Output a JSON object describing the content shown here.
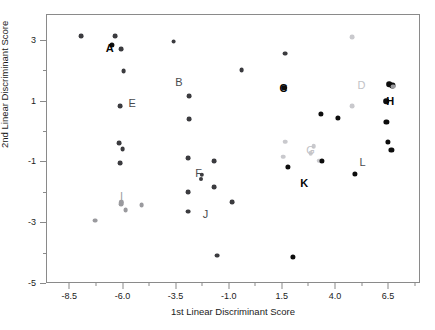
{
  "chart_data": {
    "type": "scatter",
    "title": "",
    "xlabel": "1st Linear Discriminant Score",
    "ylabel": "2nd Linear Discriminant Score",
    "xlim": [
      -9.6,
      8.0
    ],
    "ylim": [
      -5.0,
      3.85
    ],
    "xticks": [
      -8.5,
      -6.0,
      -3.5,
      -1.0,
      1.5,
      4.0,
      6.5
    ],
    "xticklabels": [
      "-8.5",
      "-6.0",
      "-3.5",
      "-1.0",
      "1.5",
      "4.0",
      "6.5"
    ],
    "yticks": [
      3,
      1,
      -1,
      -3,
      -5
    ],
    "yticklabels": [
      "3",
      "1",
      "-1",
      "-3",
      "-5"
    ],
    "xminorticks": [
      -7.25,
      -4.75,
      -2.25,
      0.25,
      2.75,
      5.25,
      7.75
    ],
    "yminorticks": [
      2,
      0,
      -2,
      -4
    ],
    "grid": false,
    "legend": "none",
    "colors": {
      "dark": "#3b3b3f",
      "black": "#0d0d0d",
      "mid": "#9a9a9e",
      "light": "#c9c9cd",
      "axis": "#8a8a8a",
      "text": "#1b1b1b"
    },
    "points": [
      {
        "x": -7.95,
        "y": 3.12,
        "tone": "dark",
        "r": 2.4
      },
      {
        "x": -6.35,
        "y": 3.12,
        "tone": "dark",
        "r": 2.4
      },
      {
        "x": -6.5,
        "y": 2.82,
        "tone": "black",
        "r": 2.6
      },
      {
        "x": -6.05,
        "y": 2.7,
        "tone": "dark",
        "r": 2.4
      },
      {
        "x": -5.95,
        "y": 1.96,
        "tone": "dark",
        "r": 2.4
      },
      {
        "x": -6.1,
        "y": 0.82,
        "tone": "dark",
        "r": 2.4
      },
      {
        "x": -6.15,
        "y": -0.4,
        "tone": "dark",
        "r": 2.4
      },
      {
        "x": -6.0,
        "y": -0.6,
        "tone": "dark",
        "r": 2.4
      },
      {
        "x": -6.12,
        "y": -1.05,
        "tone": "dark",
        "r": 2.4
      },
      {
        "x": -7.3,
        "y": -2.95,
        "tone": "mid",
        "r": 2.4
      },
      {
        "x": -6.05,
        "y": -2.4,
        "tone": "mid",
        "r": 2.4
      },
      {
        "x": -5.85,
        "y": -2.6,
        "tone": "mid",
        "r": 2.4
      },
      {
        "x": -5.1,
        "y": -2.45,
        "tone": "mid",
        "r": 2.4
      },
      {
        "x": -3.6,
        "y": 2.94,
        "tone": "dark",
        "r": 2.4
      },
      {
        "x": -2.85,
        "y": 1.15,
        "tone": "dark",
        "r": 2.4
      },
      {
        "x": -2.88,
        "y": 0.38,
        "tone": "dark",
        "r": 2.4
      },
      {
        "x": -2.92,
        "y": -0.88,
        "tone": "dark",
        "r": 2.4
      },
      {
        "x": -2.9,
        "y": -2.0,
        "tone": "dark",
        "r": 2.4
      },
      {
        "x": -2.9,
        "y": -2.65,
        "tone": "dark",
        "r": 2.4
      },
      {
        "x": -2.28,
        "y": -1.45,
        "tone": "dark",
        "r": 2.2
      },
      {
        "x": -1.7,
        "y": -1.0,
        "tone": "dark",
        "r": 2.4
      },
      {
        "x": -1.7,
        "y": -1.85,
        "tone": "dark",
        "r": 2.4
      },
      {
        "x": -1.55,
        "y": -4.1,
        "tone": "dark",
        "r": 2.4
      },
      {
        "x": -0.85,
        "y": -2.35,
        "tone": "dark",
        "r": 2.4
      },
      {
        "x": -0.4,
        "y": 2.0,
        "tone": "dark",
        "r": 2.4
      },
      {
        "x": 1.65,
        "y": 2.55,
        "tone": "dark",
        "r": 2.4
      },
      {
        "x": 1.6,
        "y": 1.42,
        "tone": "black",
        "r": 2.8
      },
      {
        "x": 1.65,
        "y": -0.35,
        "tone": "light",
        "r": 2.3
      },
      {
        "x": 1.55,
        "y": -0.85,
        "tone": "light",
        "r": 2.3
      },
      {
        "x": 1.8,
        "y": -1.18,
        "tone": "black",
        "r": 2.6
      },
      {
        "x": 2.0,
        "y": -4.15,
        "tone": "black",
        "r": 2.6
      },
      {
        "x": 2.85,
        "y": -0.72,
        "tone": "light",
        "r": 2.3
      },
      {
        "x": 3.0,
        "y": -0.5,
        "tone": "light",
        "r": 2.3
      },
      {
        "x": 3.25,
        "y": -0.98,
        "tone": "light",
        "r": 2.3
      },
      {
        "x": 3.4,
        "y": -0.98,
        "tone": "black",
        "r": 2.6
      },
      {
        "x": 3.35,
        "y": 0.55,
        "tone": "black",
        "r": 2.6
      },
      {
        "x": 4.15,
        "y": 0.42,
        "tone": "black",
        "r": 2.6
      },
      {
        "x": 4.8,
        "y": 3.1,
        "tone": "light",
        "r": 2.4
      },
      {
        "x": 4.8,
        "y": 0.82,
        "tone": "light",
        "r": 2.4
      },
      {
        "x": 4.95,
        "y": -1.4,
        "tone": "black",
        "r": 2.6
      },
      {
        "x": 6.55,
        "y": 1.55,
        "tone": "black",
        "r": 2.8
      },
      {
        "x": 6.7,
        "y": 1.5,
        "tone": "black",
        "r": 2.6
      },
      {
        "x": 6.72,
        "y": 1.46,
        "tone": "mid",
        "r": 2.4
      },
      {
        "x": 6.4,
        "y": 0.98,
        "tone": "black",
        "r": 2.8
      },
      {
        "x": 6.42,
        "y": 0.3,
        "tone": "black",
        "r": 2.6
      },
      {
        "x": 6.5,
        "y": -0.35,
        "tone": "black",
        "r": 2.6
      },
      {
        "x": 6.65,
        "y": -0.62,
        "tone": "black",
        "r": 2.6
      },
      {
        "x": -6.05,
        "y": -2.35,
        "tone": "mid",
        "r": 2.2
      },
      {
        "x": -2.3,
        "y": -1.58,
        "tone": "dark",
        "r": 2.0
      }
    ],
    "group_labels": [
      {
        "text": "A",
        "x": -6.6,
        "y": 2.72,
        "tone": "black"
      },
      {
        "text": "B",
        "x": -3.35,
        "y": 1.6,
        "tone": "dark"
      },
      {
        "text": "C",
        "x": 1.58,
        "y": 1.42,
        "tone": "black"
      },
      {
        "text": "D",
        "x": 5.25,
        "y": 1.52,
        "tone": "light"
      },
      {
        "text": "E",
        "x": -5.55,
        "y": 0.92,
        "tone": "dark"
      },
      {
        "text": "F",
        "x": -2.42,
        "y": -1.38,
        "tone": "dark"
      },
      {
        "text": "G",
        "x": 2.85,
        "y": -0.63,
        "tone": "light"
      },
      {
        "text": "H",
        "x": 6.6,
        "y": 0.98,
        "tone": "black"
      },
      {
        "text": "I",
        "x": -6.05,
        "y": -2.15,
        "tone": "mid"
      },
      {
        "text": "J",
        "x": -2.1,
        "y": -2.72,
        "tone": "dark"
      },
      {
        "text": "K",
        "x": 2.55,
        "y": -1.7,
        "tone": "black"
      },
      {
        "text": "L",
        "x": 5.3,
        "y": -1.03,
        "tone": "dark"
      }
    ]
  }
}
